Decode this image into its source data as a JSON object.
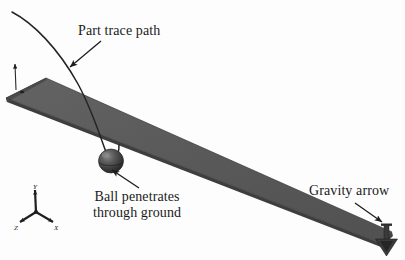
{
  "figure": {
    "type": "diagram",
    "background_color": "#fdfdfd",
    "width": 405,
    "height": 260
  },
  "annotations": [
    {
      "id": "part-trace-path",
      "text": "Part trace path",
      "leader": "arrow pointing down-left to the curved trace line"
    },
    {
      "id": "ball-penetrates",
      "line1": "Ball penetrates",
      "line2": "through ground",
      "leader": "arrow pointing up-left to the sphere"
    },
    {
      "id": "gravity-arrow",
      "text": "Gravity arrow",
      "leader": "arrow pointing down-right to the gravity vector glyph"
    }
  ],
  "axis_triad": {
    "name": "coordinate-triad",
    "axes": [
      {
        "id": "y",
        "label": "Y",
        "direction": "up"
      },
      {
        "id": "x",
        "label": "X",
        "direction": "down-right"
      },
      {
        "id": "z",
        "label": "Z",
        "direction": "down-left"
      }
    ]
  },
  "objects": {
    "ground_plank": {
      "name": "ground-plank",
      "description": "long inclined rectangular slab",
      "top_color": "#5b5b5b",
      "edge_color": "#3c3c3c",
      "side_color": "#4a4a4a"
    },
    "ball": {
      "name": "ball",
      "description": "dark shaded sphere below the plank surface",
      "color": "#3a3a3a",
      "highlight_color": "#7a7a7a"
    },
    "trace_curve": {
      "name": "part-trace-curve",
      "description": "thin curved trajectory line from upper-left to the ball",
      "color": "#262626"
    },
    "gravity_vector": {
      "name": "gravity-vector-glyph",
      "description": "downward pointing arrow with shaft and solid triangular head",
      "color": "#333333"
    },
    "origin_marker": {
      "name": "origin-marker",
      "description": "small vertical arrow and dot at the left end of the plank",
      "color": "#2a2a2a"
    }
  },
  "colors": {
    "ink": "#1a1a1a",
    "plank_top": "#5b5b5b",
    "plank_edge": "#3c3c3c",
    "ball": "#3a3a3a",
    "line": "#262626"
  }
}
